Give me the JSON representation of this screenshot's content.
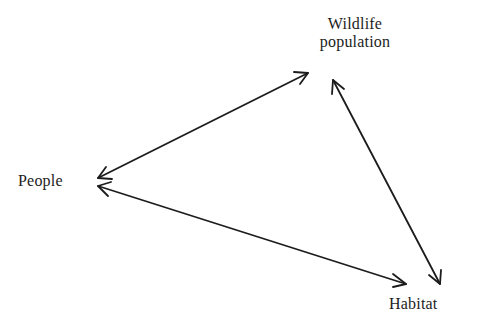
{
  "diagram": {
    "type": "relationship-triangle",
    "nodes": [
      {
        "id": "wildlife",
        "label_line1": "Wildlife",
        "label_line2": "population"
      },
      {
        "id": "people",
        "label": "People"
      },
      {
        "id": "habitat",
        "label": "Habitat"
      }
    ],
    "edges": [
      {
        "from": "wildlife",
        "to": "people",
        "direction": "bidirectional"
      },
      {
        "from": "people",
        "to": "habitat",
        "direction": "bidirectional"
      },
      {
        "from": "wildlife",
        "to": "habitat",
        "direction": "bidirectional"
      }
    ],
    "colors": {
      "stroke": "#1c1c1c",
      "text": "#1c1c1c",
      "background": "#ffffff"
    }
  }
}
